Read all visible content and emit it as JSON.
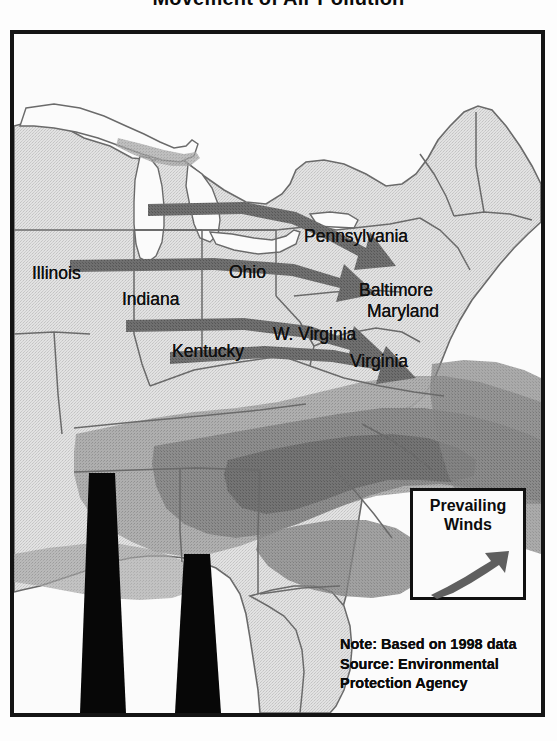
{
  "title": "Movement of Air Pollution",
  "map": {
    "frame": {
      "border_color": "#141414"
    },
    "labels": [
      {
        "id": "illinois",
        "text": "Illinois",
        "x": 18,
        "y": 240
      },
      {
        "id": "indiana",
        "text": "Indiana",
        "x": 108,
        "y": 266
      },
      {
        "id": "ohio",
        "text": "Ohio",
        "x": 215,
        "y": 239
      },
      {
        "id": "kentucky",
        "text": "Kentucky",
        "x": 158,
        "y": 318
      },
      {
        "id": "pennsylvania",
        "text": "Pennsylvania",
        "x": 299,
        "y": 203
      },
      {
        "id": "baltimore",
        "text": "Baltimore",
        "x": 355,
        "y": 257
      },
      {
        "id": "maryland",
        "text": "Maryland",
        "x": 363,
        "y": 278
      },
      {
        "id": "west-virginia",
        "text": "W. Virginia",
        "x": 269,
        "y": 301
      },
      {
        "id": "virginia",
        "text": "Virginia",
        "x": 346,
        "y": 328
      }
    ],
    "legend": {
      "line1": "Prevailing",
      "line2": "Winds",
      "arrow_icon": "wind-arrow-icon"
    },
    "note": {
      "line1": "Note: Based on 1998 data",
      "line2": "Source: Environmental",
      "line3": "Protection Agency"
    },
    "colors": {
      "land": "#d9d9d9",
      "land_dark": "#b9b9b9",
      "water": "#fafafa",
      "plume_light": "#b0b0b0",
      "plume_mid": "#8e8e8e",
      "plume_dark": "#6f6f6f",
      "arrow": "#6b6b6b",
      "border": "#6a6a6a",
      "stack": "#070707",
      "ink": "#101010"
    },
    "smokestacks": [
      {
        "id": "stack-left",
        "top_x": 75,
        "top_w": 26,
        "bottom_x": 66,
        "bottom_w": 46,
        "top_y": 469
      },
      {
        "id": "stack-right",
        "top_x": 170,
        "top_w": 26,
        "bottom_x": 162,
        "bottom_w": 46,
        "top_y": 550
      }
    ],
    "pollution_arrows": [
      {
        "id": "arrow-from-illinois-north",
        "label": "Illinois to Pennsylvania"
      },
      {
        "id": "arrow-from-illinois-mid",
        "label": "Illinois to Baltimore"
      },
      {
        "id": "arrow-from-indiana",
        "label": "Indiana to Maryland"
      },
      {
        "id": "arrow-from-kentucky",
        "label": "Kentucky to Virginia"
      }
    ]
  }
}
